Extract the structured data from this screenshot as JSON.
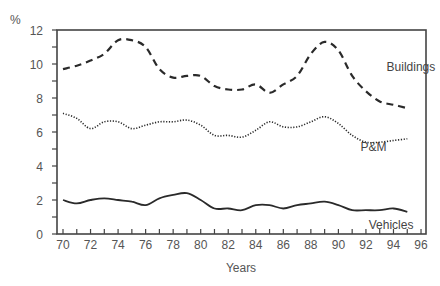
{
  "chart_data": {
    "type": "line",
    "title": "",
    "xlabel": "Years",
    "ylabel": "%",
    "xlim": [
      70,
      96
    ],
    "ylim": [
      0,
      12
    ],
    "grid": false,
    "legend": "inline labels",
    "x_ticks": [
      "70",
      "72",
      "74",
      "76",
      "78",
      "80",
      "82",
      "84",
      "86",
      "88",
      "90",
      "92",
      "94",
      "96"
    ],
    "y_ticks": [
      "0",
      "2",
      "4",
      "6",
      "8",
      "10",
      "12"
    ],
    "x": [
      70,
      71,
      72,
      73,
      74,
      75,
      76,
      77,
      78,
      79,
      80,
      81,
      82,
      83,
      84,
      85,
      86,
      87,
      88,
      89,
      90,
      91,
      92,
      93,
      94,
      95
    ],
    "series": [
      {
        "name": "Buildings",
        "style": "dashed",
        "values": [
          9.7,
          9.9,
          10.2,
          10.6,
          11.4,
          11.4,
          11.0,
          9.7,
          9.2,
          9.3,
          9.3,
          8.7,
          8.5,
          8.5,
          8.8,
          8.3,
          8.8,
          9.3,
          10.6,
          11.3,
          10.8,
          9.3,
          8.4,
          7.8,
          7.6,
          7.4
        ]
      },
      {
        "name": "P&M",
        "style": "dotted",
        "values": [
          7.1,
          6.8,
          6.2,
          6.6,
          6.6,
          6.2,
          6.4,
          6.6,
          6.6,
          6.7,
          6.4,
          5.8,
          5.8,
          5.7,
          6.1,
          6.6,
          6.3,
          6.3,
          6.6,
          6.9,
          6.5,
          5.8,
          5.4,
          5.4,
          5.5,
          5.6
        ]
      },
      {
        "name": "Vehicles",
        "style": "solid",
        "values": [
          2.0,
          1.8,
          2.0,
          2.1,
          2.0,
          1.9,
          1.7,
          2.1,
          2.3,
          2.4,
          2.0,
          1.5,
          1.5,
          1.4,
          1.7,
          1.7,
          1.5,
          1.7,
          1.8,
          1.9,
          1.7,
          1.4,
          1.4,
          1.4,
          1.5,
          1.3
        ]
      }
    ],
    "labels": {
      "Buildings": {
        "x": 93.5,
        "y": 9.6
      },
      "P&M": {
        "x": 91.6,
        "y": 4.9
      },
      "Vehicles": {
        "x": 92.2,
        "y": 0.3
      }
    },
    "colors": {
      "line": "#2a2a2a",
      "axis": "#444444",
      "text": "#555555"
    }
  }
}
